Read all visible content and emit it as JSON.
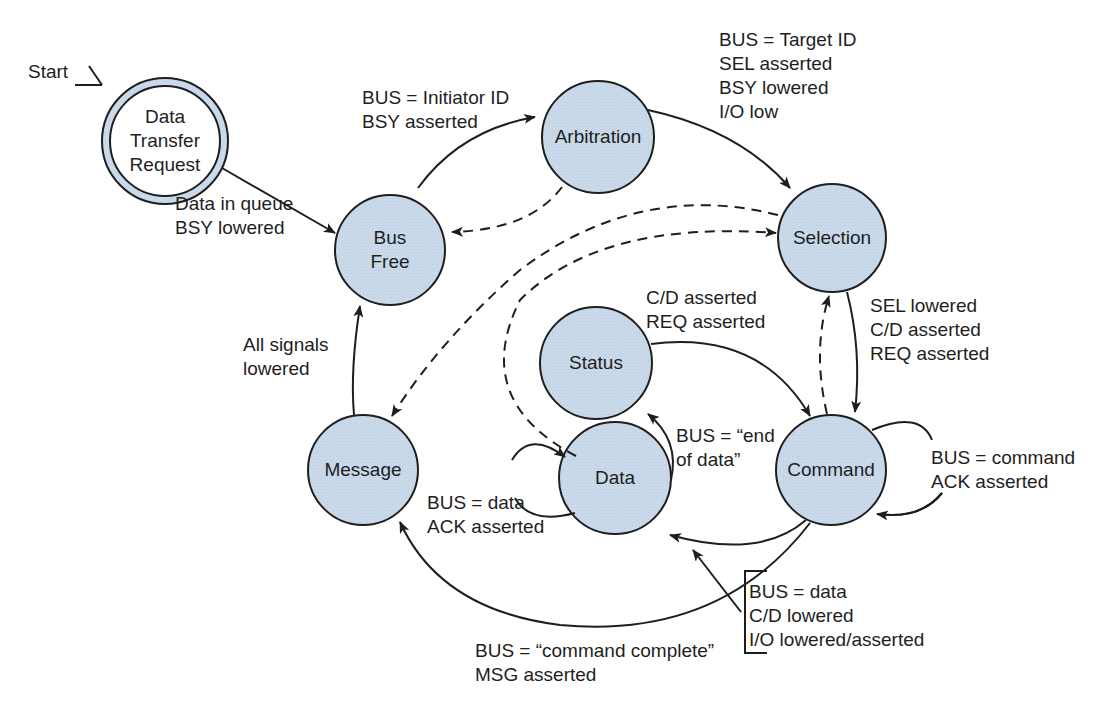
{
  "diagram": {
    "type": "state-diagram",
    "colors": {
      "node_fill": "#c9d9ea",
      "stroke": "#1e1e1e",
      "background": "#ffffff"
    },
    "start_label": "Start",
    "nodes": [
      {
        "id": "dtr",
        "label": "Data\nTransfer\nRequest",
        "kind": "initial"
      },
      {
        "id": "busfree",
        "label": "Bus\nFree"
      },
      {
        "id": "arbitration",
        "label": "Arbitration"
      },
      {
        "id": "selection",
        "label": "Selection"
      },
      {
        "id": "status",
        "label": "Status"
      },
      {
        "id": "message",
        "label": "Message"
      },
      {
        "id": "data",
        "label": "Data"
      },
      {
        "id": "command",
        "label": "Command"
      }
    ],
    "edges": [
      {
        "from": "dtr",
        "to": "busfree",
        "style": "solid",
        "label": "Data in queue\nBSY lowered"
      },
      {
        "from": "busfree",
        "to": "arbitration",
        "style": "solid",
        "label": "BUS = Initiator ID\nBSY asserted"
      },
      {
        "from": "arbitration",
        "to": "selection",
        "style": "solid",
        "label": "BUS = Target ID\nSEL asserted\nBSY lowered\nI/O low"
      },
      {
        "from": "arbitration",
        "to": "busfree",
        "style": "dashed",
        "label": ""
      },
      {
        "from": "selection",
        "to": "message",
        "style": "dashed",
        "label": ""
      },
      {
        "from": "data",
        "to": "selection",
        "style": "dashed",
        "label": ""
      },
      {
        "from": "command",
        "to": "selection",
        "style": "dashed",
        "label": ""
      },
      {
        "from": "selection",
        "to": "command",
        "style": "solid",
        "label": "SEL lowered\nC/D asserted\nREQ asserted"
      },
      {
        "from": "status",
        "to": "command",
        "style": "solid",
        "label": "C/D asserted\nREQ asserted"
      },
      {
        "from": "command",
        "to": "command",
        "style": "solid",
        "label": "BUS = command\nACK asserted"
      },
      {
        "from": "data",
        "to": "data",
        "style": "solid",
        "label": "BUS = data\nACK asserted"
      },
      {
        "from": "data",
        "to": "status",
        "style": "solid",
        "label": "BUS = “end\nof data”"
      },
      {
        "from": "command",
        "to": "data",
        "style": "solid",
        "label": "BUS = data\nC/D lowered\nI/O lowered/asserted"
      },
      {
        "from": "command",
        "to": "message",
        "style": "solid",
        "label": "BUS = “command complete”\nMSG asserted"
      },
      {
        "from": "message",
        "to": "busfree",
        "style": "solid",
        "label": "All signals\nlowered"
      }
    ]
  }
}
